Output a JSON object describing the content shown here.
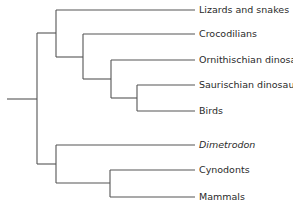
{
  "diagram": {
    "type": "cladogram",
    "line_color": "#555555",
    "taxa": [
      {
        "name": "Lizards and snakes",
        "italic": false
      },
      {
        "name": "Crocodilians",
        "italic": false
      },
      {
        "name": "Ornithischian dinosaurs",
        "italic": false
      },
      {
        "name": "Saurischian dinosaurs",
        "italic": false
      },
      {
        "name": "Birds",
        "italic": false
      },
      {
        "name": "Dimetrodon",
        "italic": true
      },
      {
        "name": "Cynodonts",
        "italic": false
      },
      {
        "name": "Mammals",
        "italic": false
      }
    ]
  }
}
